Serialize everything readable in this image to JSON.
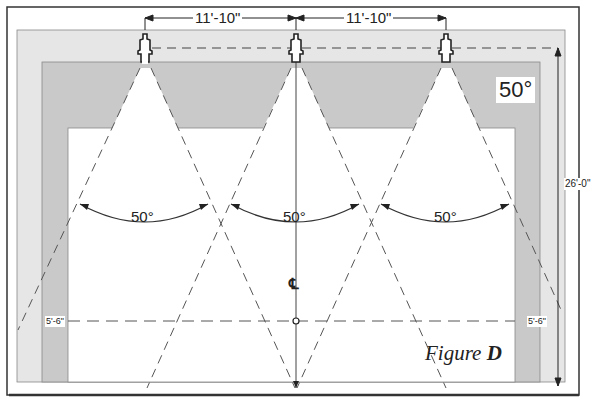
{
  "figure": {
    "title": "Figure",
    "letter": "D"
  },
  "dimensions": {
    "spacing_left": "11'-10\"",
    "spacing_right": "11'-10\"",
    "height": "26'-0\"",
    "centerline_height_left": "5'-6\"",
    "centerline_height_right": "5'-6\""
  },
  "spray": {
    "angle_label": "50°",
    "cone_angles": [
      "50°",
      "50°",
      "50°"
    ],
    "nozzle_count": 3
  },
  "centerline": {
    "symbol": "℄"
  },
  "colors": {
    "outer_panel": "#e6e6e6",
    "band": "#c9c9c9",
    "line": "#333333",
    "background": "#ffffff"
  }
}
